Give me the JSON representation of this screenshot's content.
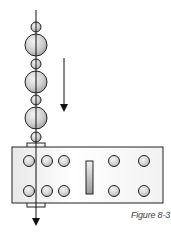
{
  "figure": {
    "caption": "Figure 8-3",
    "colors": {
      "outline": "#222222",
      "bead_fill_light": "#f2f2f2",
      "bead_fill_dark": "#a8a8a8",
      "plate_fill_light": "#ffffff",
      "plate_fill_dark": "#e6e6e6"
    },
    "beads": [
      {
        "size": "small",
        "cy": 27,
        "r": 5
      },
      {
        "size": "large",
        "cy": 45,
        "r": 11
      },
      {
        "size": "small",
        "cy": 64,
        "r": 5
      },
      {
        "size": "large",
        "cy": 82,
        "r": 11
      },
      {
        "size": "small",
        "cy": 100,
        "r": 5
      },
      {
        "size": "large",
        "cy": 118,
        "r": 11
      },
      {
        "size": "small",
        "cy": 137,
        "r": 5
      }
    ],
    "plate": {
      "hole_rows": 2,
      "hole_columns": 5,
      "center_slot": true
    },
    "direction_arrow": "down"
  }
}
